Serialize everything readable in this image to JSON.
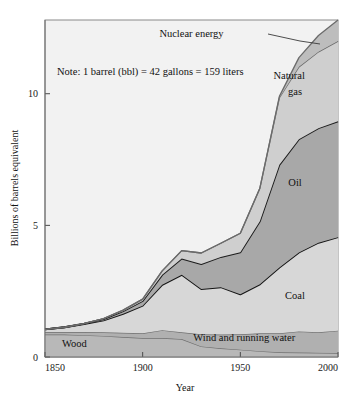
{
  "figure": {
    "note": "Note: 1 barrel (bbl) = 42 gallons = 159 liters",
    "background_color": "#f2f2f2",
    "frame_color": "#8a8a8a"
  },
  "chart_data": {
    "type": "area",
    "title": "",
    "xlabel": "Year",
    "ylabel": "Billions of barrels equivalent",
    "xlim": [
      1850,
      2000
    ],
    "ylim": [
      0,
      12.8
    ],
    "xticks": [
      1850,
      1900,
      1950,
      2000
    ],
    "xtick_labels": [
      "1850",
      "1900",
      "1950",
      "2000"
    ],
    "yticks": [
      0,
      5,
      10
    ],
    "ytick_labels": [
      "0",
      "5",
      "10"
    ],
    "grid": false,
    "legend": "inline-band-labels",
    "stacked": true,
    "x": [
      1850,
      1860,
      1870,
      1880,
      1890,
      1900,
      1910,
      1920,
      1930,
      1940,
      1950,
      1960,
      1970,
      1980,
      1990,
      2000
    ],
    "series": [
      {
        "name": "Wood",
        "label": "Wood",
        "color": "#b8b8b8",
        "stroke": "#6f6f6f",
        "values": [
          0.85,
          0.85,
          0.83,
          0.8,
          0.76,
          0.72,
          0.72,
          0.68,
          0.4,
          0.33,
          0.28,
          0.22,
          0.18,
          0.17,
          0.16,
          0.15
        ]
      },
      {
        "name": "Wind and running water",
        "label": "Wind and running water",
        "color": "#b0b0b0",
        "stroke": "#6f6f6f",
        "values": [
          0.1,
          0.1,
          0.12,
          0.14,
          0.16,
          0.18,
          0.3,
          0.26,
          0.46,
          0.52,
          0.58,
          0.68,
          0.72,
          0.8,
          0.78,
          0.85
        ]
      },
      {
        "name": "Coal",
        "label": "Coal",
        "color": "#d7d7d7",
        "stroke": "#141414",
        "values": [
          0.1,
          0.18,
          0.3,
          0.45,
          0.72,
          1.05,
          1.72,
          2.18,
          1.72,
          1.8,
          1.52,
          1.86,
          2.5,
          3.0,
          3.4,
          3.55
        ]
      },
      {
        "name": "Oil",
        "label": "Oil",
        "color": "#a8a8a8",
        "stroke": "#1c1c1c",
        "values": [
          0.0,
          0.0,
          0.02,
          0.05,
          0.1,
          0.18,
          0.38,
          0.62,
          0.95,
          1.15,
          1.6,
          2.4,
          3.9,
          4.3,
          4.35,
          4.4
        ]
      },
      {
        "name": "Natural gas",
        "label": "Natural\ngas",
        "color": "#cfcfcf",
        "stroke": "#6b6b6b",
        "values": [
          0.0,
          0.0,
          0.0,
          0.02,
          0.04,
          0.07,
          0.15,
          0.3,
          0.42,
          0.52,
          0.72,
          1.25,
          2.55,
          2.75,
          2.9,
          3.05
        ]
      },
      {
        "name": "Nuclear energy",
        "label": "Nuclear energy",
        "color": "#bdbdbd",
        "stroke": "#6b6b6b",
        "values": [
          0.0,
          0.0,
          0.0,
          0.0,
          0.0,
          0.0,
          0.0,
          0.0,
          0.0,
          0.0,
          0.0,
          0.0,
          0.05,
          0.35,
          0.62,
          0.8
        ]
      }
    ],
    "band_labels": [
      {
        "name": "wood",
        "text": "Wood",
        "x": 1865,
        "y": 0.38
      },
      {
        "name": "wind-and-running-water",
        "text": "Wind and running water",
        "x": 1952,
        "y": 0.6
      },
      {
        "name": "coal",
        "text": "Coal",
        "x": 1978,
        "y": 2.2
      },
      {
        "name": "oil",
        "text": "Oil",
        "x": 1978,
        "y": 6.5
      },
      {
        "name": "natural-gas",
        "text": "Natural",
        "x": 1975,
        "y": 10.55
      },
      {
        "name": "natural-gas-2",
        "text": "gas",
        "x": 1978,
        "y": 9.95
      },
      {
        "name": "nuclear-energy",
        "text": "Nuclear energy",
        "x": 1925,
        "y": 12.15
      }
    ]
  }
}
